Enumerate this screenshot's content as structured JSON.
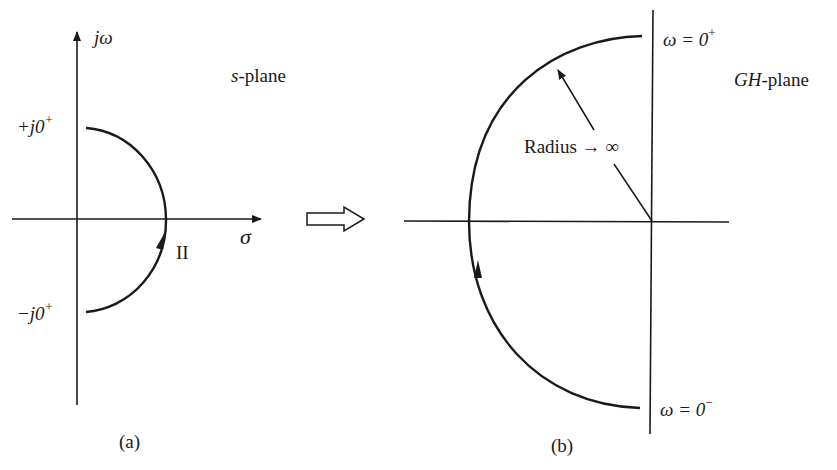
{
  "figure": {
    "panel_a": {
      "caption": "(a)",
      "plane_label_italic": "s",
      "plane_label_rest": "-plane",
      "vertical_axis_label": "jω",
      "horizontal_axis_label": "σ",
      "upper_point_label": "+j0",
      "upper_point_sup": "+",
      "lower_point_label": "−j0",
      "lower_point_sup": "+",
      "contour_label": "II"
    },
    "transition_arrow": "hollow-right-arrow",
    "panel_b": {
      "caption": "(b)",
      "plane_label_italic": "GH",
      "plane_label_rest": "-plane",
      "top_point_label": "ω = 0",
      "top_point_sup": "+",
      "bottom_point_label": "ω = 0",
      "bottom_point_sup": "−",
      "radius_label": "Radius → ∞"
    },
    "colors": {
      "ink": "#1a1a1a",
      "background": "#ffffff"
    }
  }
}
